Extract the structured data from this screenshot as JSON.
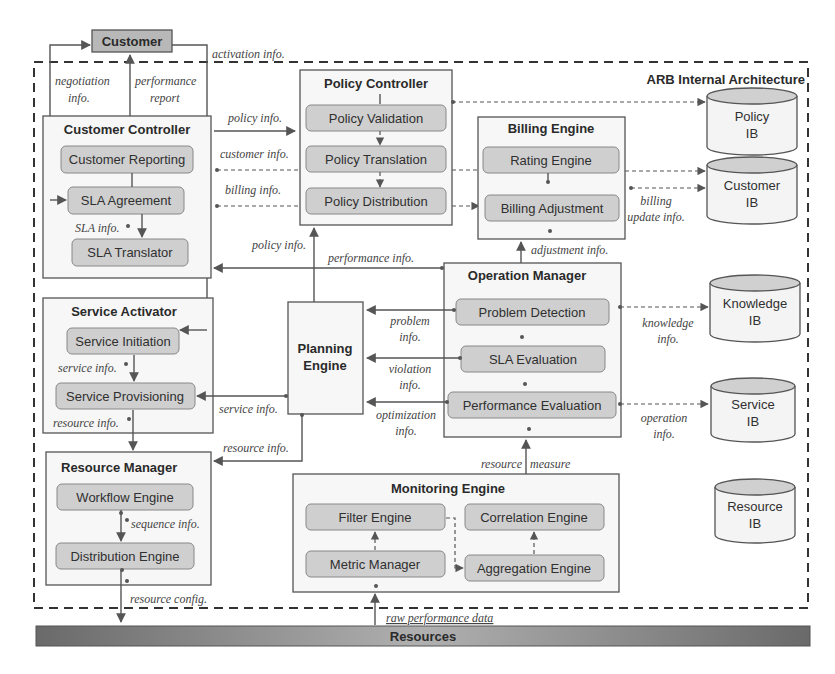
{
  "diagram": {
    "boundary_label": "ARB Internal Architecture",
    "external": {
      "customer": "Customer",
      "resources": "Resources"
    },
    "components": {
      "customer_controller": {
        "title": "Customer Controller",
        "modules": [
          "Customer Reporting",
          "SLA Agreement",
          "SLA Translator"
        ]
      },
      "policy_controller": {
        "title": "Policy Controller",
        "modules": [
          "Policy Validation",
          "Policy Translation",
          "Policy Distribution"
        ]
      },
      "billing_engine": {
        "title": "Billing Engine",
        "modules": [
          "Rating Engine",
          "Billing Adjustment"
        ]
      },
      "service_activator": {
        "title": "Service Activator",
        "modules": [
          "Service Initiation",
          "Service Provisioning"
        ]
      },
      "planning_engine": {
        "title_line1": "Planning",
        "title_line2": "Engine"
      },
      "operation_manager": {
        "title": "Operation Manager",
        "modules": [
          "Problem Detection",
          "SLA Evaluation",
          "Performance Evaluation"
        ]
      },
      "resource_manager": {
        "title": "Resource Manager",
        "modules": [
          "Workflow Engine",
          "Distribution Engine"
        ]
      },
      "monitoring_engine": {
        "title": "Monitoring Engine",
        "modules": [
          "Filter Engine",
          "Correlation Engine",
          "Metric Manager",
          "Aggregation Engine"
        ]
      }
    },
    "information_bases": [
      {
        "line1": "Policy",
        "line2": "IB"
      },
      {
        "line1": "Customer",
        "line2": "IB"
      },
      {
        "line1": "Knowledge",
        "line2": "IB"
      },
      {
        "line1": "Service",
        "line2": "IB"
      },
      {
        "line1": "Resource",
        "line2": "IB"
      }
    ],
    "flow_labels": {
      "activation_info": "activation info.",
      "negotiation_info_1": "negotiation",
      "negotiation_info_2": "info.",
      "performance_report_1": "performance",
      "performance_report_2": "report",
      "policy_info_top": "policy info.",
      "customer_info": "customer info.",
      "billing_info": "billing info.",
      "sla_info": "SLA info.",
      "policy_info_mid": "policy info.",
      "performance_info": "performance info.",
      "adjustment_info": "adjustment info.",
      "billing_update_1": "billing",
      "billing_update_2": "update info.",
      "problem_info_1": "problem",
      "problem_info_2": "info.",
      "violation_info_1": "violation",
      "violation_info_2": "info.",
      "optimization_info_1": "optimization",
      "optimization_info_2": "info.",
      "knowledge_info_1": "knowledge",
      "knowledge_info_2": "info.",
      "operation_info_1": "operation",
      "operation_info_2": "info.",
      "service_info_sa": "service info.",
      "service_info_pe": "service info.",
      "resource_info_sa": "resource info.",
      "resource_info_pe": "resource info.",
      "resource_measure_1": "resource",
      "resource_measure_2": "measure",
      "sequence_info": "sequence info.",
      "resource_config": "resource config.",
      "raw_performance_data": "raw performance data"
    }
  }
}
